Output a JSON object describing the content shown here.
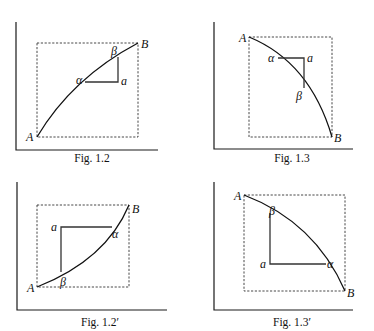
{
  "figures": [
    {
      "id": "fig-1-2",
      "caption": "Fig. 1.2",
      "labels": {
        "A": "A",
        "B": "B",
        "alpha": "α",
        "beta": "β",
        "a": "a"
      }
    },
    {
      "id": "fig-1-3",
      "caption": "Fig. 1.3",
      "labels": {
        "A": "A",
        "B": "B",
        "alpha": "α",
        "beta": "β",
        "a": "a"
      }
    },
    {
      "id": "fig-1-2-prime",
      "caption": "Fig. 1.2′",
      "labels": {
        "A": "A",
        "B": "B",
        "alpha": "α",
        "beta": "β",
        "a": "a"
      }
    },
    {
      "id": "fig-1-3-prime",
      "caption": "Fig. 1.3′",
      "labels": {
        "A": "A",
        "B": "B",
        "alpha": "α",
        "beta": "β",
        "a": "a"
      }
    }
  ]
}
